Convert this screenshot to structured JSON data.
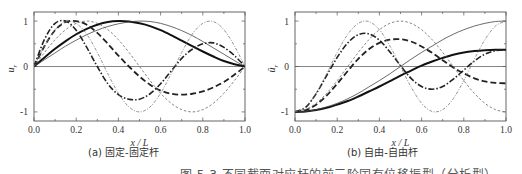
{
  "figure": {
    "caption": "图 5.3  不同截面对应杆的前三阶固有位移振型（分析型）"
  },
  "chart_data": [
    {
      "id": "a",
      "type": "line",
      "subcaption": "(a) 固定-固定杆",
      "xlabel": "x / L",
      "ylabel": "u_r",
      "ylabel_main": "u",
      "ylabel_sub": "r",
      "xlim": [
        0.0,
        1.0
      ],
      "ylim": [
        -1.2,
        1.2
      ],
      "xticks": [
        "0.0",
        "0.2",
        "0.4",
        "0.6",
        "0.8",
        "1.0"
      ],
      "yticks": [
        "1",
        "0",
        "-1"
      ],
      "grid": false,
      "zero_line": true,
      "series": [
        {
          "name": "mode1-nonuniform",
          "style": "thick-solid",
          "x": [
            0,
            0.05,
            0.1,
            0.15,
            0.2,
            0.25,
            0.3,
            0.35,
            0.4,
            0.45,
            0.5,
            0.55,
            0.6,
            0.65,
            0.7,
            0.75,
            0.8,
            0.85,
            0.9,
            0.95,
            1.0
          ],
          "y": [
            0,
            0.2,
            0.39,
            0.56,
            0.71,
            0.83,
            0.92,
            0.98,
            1.0,
            0.99,
            0.95,
            0.89,
            0.8,
            0.69,
            0.57,
            0.45,
            0.33,
            0.22,
            0.12,
            0.05,
            0
          ]
        },
        {
          "name": "mode1-uniform",
          "style": "thin-solid",
          "x": [
            0,
            0.05,
            0.1,
            0.15,
            0.2,
            0.25,
            0.3,
            0.35,
            0.4,
            0.45,
            0.5,
            0.55,
            0.6,
            0.65,
            0.7,
            0.75,
            0.8,
            0.85,
            0.9,
            0.95,
            1.0
          ],
          "y": [
            0,
            0.15,
            0.3,
            0.45,
            0.58,
            0.7,
            0.8,
            0.88,
            0.94,
            0.98,
            1.0,
            0.99,
            0.95,
            0.88,
            0.79,
            0.68,
            0.55,
            0.41,
            0.27,
            0.13,
            0
          ]
        },
        {
          "name": "mode2-nonuniform",
          "style": "thick-dash",
          "x": [
            0,
            0.05,
            0.1,
            0.15,
            0.2,
            0.25,
            0.3,
            0.35,
            0.4,
            0.45,
            0.5,
            0.55,
            0.6,
            0.65,
            0.7,
            0.75,
            0.8,
            0.85,
            0.9,
            0.95,
            1.0
          ],
          "y": [
            0,
            0.45,
            0.8,
            0.98,
            1.0,
            0.92,
            0.74,
            0.5,
            0.24,
            0.0,
            -0.22,
            -0.4,
            -0.53,
            -0.6,
            -0.62,
            -0.6,
            -0.55,
            -0.46,
            -0.34,
            -0.18,
            0
          ]
        },
        {
          "name": "mode2-uniform",
          "style": "thin-dash",
          "x": [
            0,
            0.05,
            0.1,
            0.15,
            0.2,
            0.25,
            0.3,
            0.35,
            0.4,
            0.45,
            0.5,
            0.55,
            0.6,
            0.65,
            0.7,
            0.75,
            0.8,
            0.85,
            0.9,
            0.95,
            1.0
          ],
          "y": [
            0,
            0.31,
            0.59,
            0.81,
            0.95,
            1.0,
            0.95,
            0.81,
            0.59,
            0.31,
            0,
            -0.31,
            -0.59,
            -0.81,
            -0.95,
            -1.0,
            -0.95,
            -0.81,
            -0.59,
            -0.31,
            0
          ]
        },
        {
          "name": "mode3-nonuniform",
          "style": "thick-dashdot",
          "x": [
            0,
            0.05,
            0.1,
            0.15,
            0.2,
            0.25,
            0.3,
            0.35,
            0.4,
            0.45,
            0.5,
            0.55,
            0.6,
            0.65,
            0.7,
            0.75,
            0.8,
            0.85,
            0.9,
            0.95,
            1.0
          ],
          "y": [
            0,
            0.6,
            0.95,
            1.0,
            0.8,
            0.42,
            0.0,
            -0.38,
            -0.62,
            -0.72,
            -0.72,
            -0.6,
            -0.38,
            -0.1,
            0.18,
            0.38,
            0.5,
            0.52,
            0.42,
            0.24,
            0
          ]
        },
        {
          "name": "mode3-uniform",
          "style": "thin-dot",
          "x": [
            0,
            0.05,
            0.1,
            0.15,
            0.2,
            0.25,
            0.3,
            0.35,
            0.4,
            0.45,
            0.5,
            0.55,
            0.6,
            0.65,
            0.7,
            0.75,
            0.8,
            0.85,
            0.9,
            0.95,
            1.0
          ],
          "y": [
            0,
            0.45,
            0.81,
            0.99,
            0.95,
            0.71,
            0.31,
            -0.16,
            -0.59,
            -0.89,
            -1.0,
            -0.89,
            -0.59,
            -0.16,
            0.31,
            0.71,
            0.95,
            0.99,
            0.81,
            0.45,
            0
          ]
        }
      ]
    },
    {
      "id": "b",
      "type": "line",
      "subcaption": "(b) 自由-自由杆",
      "xlabel": "x / L",
      "ylabel": "û_r",
      "ylabel_main": "û",
      "ylabel_sub": "r",
      "xlim": [
        0.0,
        1.0
      ],
      "ylim": [
        -1.2,
        1.2
      ],
      "xticks": [
        "0.0",
        "0.2",
        "0.4",
        "0.6",
        "0.8",
        "1.0"
      ],
      "yticks": [
        "1",
        "0",
        "-1"
      ],
      "grid": false,
      "zero_line": true,
      "series": [
        {
          "name": "mode1-nonuniform",
          "style": "thick-solid",
          "x": [
            0,
            0.05,
            0.1,
            0.15,
            0.2,
            0.25,
            0.3,
            0.35,
            0.4,
            0.45,
            0.5,
            0.55,
            0.6,
            0.65,
            0.7,
            0.75,
            0.8,
            0.85,
            0.9,
            0.95,
            1.0
          ],
          "y": [
            -1.0,
            -0.99,
            -0.96,
            -0.91,
            -0.84,
            -0.76,
            -0.66,
            -0.55,
            -0.44,
            -0.32,
            -0.2,
            -0.09,
            0.02,
            0.11,
            0.19,
            0.26,
            0.31,
            0.34,
            0.36,
            0.37,
            0.37
          ]
        },
        {
          "name": "mode1-uniform",
          "style": "thin-solid",
          "x": [
            0,
            0.05,
            0.1,
            0.15,
            0.2,
            0.25,
            0.3,
            0.35,
            0.4,
            0.45,
            0.5,
            0.55,
            0.6,
            0.65,
            0.7,
            0.75,
            0.8,
            0.85,
            0.9,
            0.95,
            1.0
          ],
          "y": [
            -1.0,
            -0.99,
            -0.95,
            -0.89,
            -0.81,
            -0.71,
            -0.59,
            -0.45,
            -0.31,
            -0.16,
            0,
            0.16,
            0.31,
            0.45,
            0.59,
            0.71,
            0.81,
            0.89,
            0.95,
            0.99,
            1.0
          ]
        },
        {
          "name": "mode2-nonuniform",
          "style": "thick-dash",
          "x": [
            0,
            0.05,
            0.1,
            0.15,
            0.2,
            0.25,
            0.3,
            0.35,
            0.4,
            0.45,
            0.5,
            0.55,
            0.6,
            0.65,
            0.7,
            0.75,
            0.8,
            0.85,
            0.9,
            0.95,
            1.0
          ],
          "y": [
            -1.0,
            -0.96,
            -0.84,
            -0.64,
            -0.38,
            -0.1,
            0.17,
            0.38,
            0.52,
            0.59,
            0.6,
            0.55,
            0.44,
            0.3,
            0.14,
            -0.02,
            -0.15,
            -0.26,
            -0.33,
            -0.36,
            -0.37
          ]
        },
        {
          "name": "mode2-uniform",
          "style": "thin-dash",
          "x": [
            0,
            0.05,
            0.1,
            0.15,
            0.2,
            0.25,
            0.3,
            0.35,
            0.4,
            0.45,
            0.5,
            0.55,
            0.6,
            0.65,
            0.7,
            0.75,
            0.8,
            0.85,
            0.9,
            0.95,
            1.0
          ],
          "y": [
            -1.0,
            -0.95,
            -0.81,
            -0.59,
            -0.31,
            0,
            0.31,
            0.59,
            0.81,
            0.95,
            1.0,
            0.95,
            0.81,
            0.59,
            0.31,
            0,
            -0.31,
            -0.59,
            -0.81,
            -0.95,
            -1.0
          ]
        },
        {
          "name": "mode3-nonuniform",
          "style": "thick-dashdot",
          "x": [
            0,
            0.05,
            0.1,
            0.15,
            0.2,
            0.25,
            0.3,
            0.35,
            0.4,
            0.45,
            0.5,
            0.55,
            0.6,
            0.65,
            0.7,
            0.75,
            0.8,
            0.85,
            0.9,
            0.95,
            1.0
          ],
          "y": [
            -1.0,
            -0.9,
            -0.6,
            -0.2,
            0.2,
            0.52,
            0.7,
            0.72,
            0.58,
            0.32,
            0.02,
            -0.26,
            -0.44,
            -0.5,
            -0.44,
            -0.28,
            -0.08,
            0.12,
            0.27,
            0.35,
            0.37
          ]
        },
        {
          "name": "mode3-uniform",
          "style": "thin-dot",
          "x": [
            0,
            0.05,
            0.1,
            0.15,
            0.2,
            0.25,
            0.3,
            0.35,
            0.4,
            0.45,
            0.5,
            0.55,
            0.6,
            0.65,
            0.7,
            0.75,
            0.8,
            0.85,
            0.9,
            0.95,
            1.0
          ],
          "y": [
            -1.0,
            -0.89,
            -0.59,
            -0.16,
            0.31,
            0.71,
            0.95,
            0.99,
            0.81,
            0.45,
            0,
            -0.45,
            -0.81,
            -0.99,
            -0.95,
            -0.71,
            -0.31,
            0.16,
            0.59,
            0.89,
            1.0
          ]
        }
      ]
    }
  ]
}
